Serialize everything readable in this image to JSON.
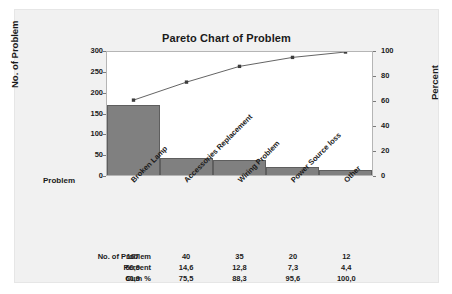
{
  "chart_data": {
    "type": "bar",
    "title": "Pareto Chart of Problem",
    "xlabel": "Problem",
    "ylabel": "No. of Problem",
    "y2label": "Percent",
    "categories": [
      "Broken Lamp",
      "Accessories Replacement",
      "Wiring Problem",
      "Power Source loss",
      "Other"
    ],
    "values": [
      167,
      40,
      35,
      20,
      12
    ],
    "series": [
      {
        "name": "No. of Problem",
        "values": [
          167,
          40,
          35,
          20,
          12
        ]
      },
      {
        "name": "Cum %",
        "values": [
          60.9,
          75.5,
          88.3,
          95.6,
          100.0
        ]
      }
    ],
    "percent": [
      60.9,
      14.6,
      12.8,
      7.3,
      4.4
    ],
    "cum_percent": [
      60.9,
      75.5,
      88.3,
      95.6,
      100.0
    ],
    "ylim": [
      0,
      300
    ],
    "y2lim": [
      0,
      100
    ],
    "yticks": [
      300,
      250,
      200,
      150,
      100,
      50,
      0
    ],
    "y2ticks": [
      100,
      80,
      60,
      40,
      20,
      0
    ],
    "grid": false,
    "legend": "none",
    "bar_color": "#808080",
    "line_color": "#3c3c3c",
    "total": 274
  },
  "table": {
    "rows": [
      {
        "label": "No. of Problem",
        "cells": [
          "167",
          "40",
          "35",
          "20",
          "12"
        ]
      },
      {
        "label": "Percent",
        "cells": [
          "60,9",
          "14,6",
          "12,8",
          "7,3",
          "4,4"
        ]
      },
      {
        "label": "Cum %",
        "cells": [
          "60,9",
          "75,5",
          "88,3",
          "95,6",
          "100,0"
        ]
      }
    ]
  },
  "axis": {
    "y_left_ticks": [
      "300",
      "250",
      "200",
      "150",
      "100",
      "50",
      "0"
    ],
    "y_right_ticks": [
      "100",
      "80",
      "60",
      "40",
      "20",
      "0"
    ],
    "category_axis_label": "Problem"
  }
}
